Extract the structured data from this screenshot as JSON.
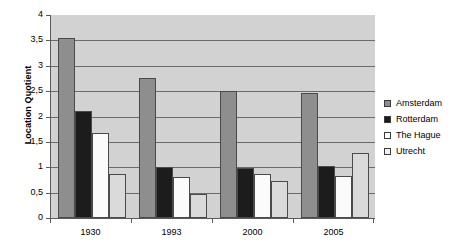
{
  "chart_data": {
    "type": "bar",
    "title": "",
    "subtitle": "",
    "xlabel": "",
    "ylabel": "Location Quotient",
    "ylim": [
      0,
      4
    ],
    "ytick_step": 0.5,
    "ytick_labels": [
      "0",
      "0,5",
      "1",
      "1,5",
      "2",
      "2,5",
      "3",
      "3,5",
      "4"
    ],
    "ytick_values": [
      0,
      0.5,
      1,
      1.5,
      2,
      2.5,
      3,
      3.5,
      4
    ],
    "decimal_separator": ",",
    "grid": true,
    "grid_axis": "y",
    "legend_position": "right",
    "categories": [
      "1930",
      "1993",
      "2000",
      "2005"
    ],
    "series": [
      {
        "name": "Amsterdam",
        "color": "#8e8e8e",
        "values": [
          3.55,
          2.75,
          2.5,
          2.47
        ]
      },
      {
        "name": "Rotterdam",
        "color": "#1c1c1c",
        "values": [
          2.1,
          1.0,
          0.99,
          1.02
        ]
      },
      {
        "name": "The Hague",
        "color": "#ffffff",
        "values": [
          1.68,
          0.8,
          0.87,
          0.82
        ]
      },
      {
        "name": "Utrecht",
        "color": "#f2f2f2",
        "values": [
          0.87,
          0.48,
          0.72,
          1.28
        ]
      }
    ],
    "plot_background": "#d2d2d2",
    "gridline_color": "#6b6b6b",
    "axis_color": "#5a5a5a"
  }
}
